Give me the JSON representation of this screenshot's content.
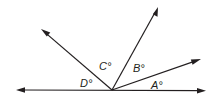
{
  "diagram": {
    "type": "angles-on-a-line",
    "colors": {
      "line": "#231f20",
      "background": "#ffffff"
    },
    "vertex": {
      "x": 112,
      "y": 90
    },
    "baseline": {
      "left_end": {
        "x": 16,
        "y": 90
      },
      "right_end": {
        "x": 206,
        "y": 91
      }
    },
    "rays": [
      {
        "name": "ray-right-low",
        "end": {
          "x": 201,
          "y": 59
        }
      },
      {
        "name": "ray-upper-right",
        "end": {
          "x": 158,
          "y": 7
        }
      },
      {
        "name": "ray-upper-left",
        "end": {
          "x": 41,
          "y": 29
        }
      }
    ],
    "labels": {
      "A": "A°",
      "B": "B°",
      "C": "C°",
      "D": "D°"
    }
  }
}
